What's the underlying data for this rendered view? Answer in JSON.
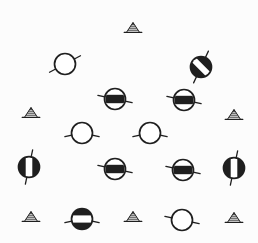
{
  "canvas": {
    "width": 258,
    "height": 243,
    "background": "#fcfcfc",
    "ink": "#1f1f1f"
  },
  "symbols": [
    {
      "type": "triangle",
      "x": 133,
      "y": 28
    },
    {
      "type": "circle",
      "x": 65,
      "y": 64,
      "fill": "white",
      "band": "none",
      "stubs": [
        -28,
        152
      ]
    },
    {
      "type": "circle",
      "x": 201,
      "y": 67,
      "fill": "black",
      "band": "diagonal-white",
      "band_angle": 45,
      "band_thickness": 6,
      "stubs": [
        -65,
        115
      ]
    },
    {
      "type": "circle",
      "x": 115,
      "y": 99,
      "fill": "white",
      "band": "horizontal-black",
      "band_angle": 0,
      "band_thickness": 8.4,
      "stubs": [
        12,
        192
      ]
    },
    {
      "type": "circle",
      "x": 184,
      "y": 100,
      "fill": "white",
      "band": "horizontal-black",
      "band_angle": 0,
      "band_thickness": 8.4,
      "stubs": [
        12,
        192
      ]
    },
    {
      "type": "triangle",
      "x": 31,
      "y": 113
    },
    {
      "type": "triangle",
      "x": 234,
      "y": 115
    },
    {
      "type": "circle",
      "x": 82,
      "y": 133,
      "fill": "white",
      "band": "none",
      "stubs": [
        12,
        168
      ]
    },
    {
      "type": "circle",
      "x": 150,
      "y": 133,
      "fill": "white",
      "band": "none",
      "stubs": [
        12,
        168
      ]
    },
    {
      "type": "circle",
      "x": 29,
      "y": 167,
      "fill": "black",
      "band": "vertical-white",
      "band_angle": 90,
      "band_thickness": 6.6,
      "stubs": [
        -78,
        102
      ]
    },
    {
      "type": "circle",
      "x": 115,
      "y": 169,
      "fill": "white",
      "band": "horizontal-black",
      "band_angle": 0,
      "band_thickness": 8.4,
      "stubs": [
        12,
        192
      ]
    },
    {
      "type": "circle",
      "x": 183,
      "y": 170,
      "fill": "white",
      "band": "horizontal-black",
      "band_angle": 0,
      "band_thickness": 8.4,
      "stubs": [
        12,
        192
      ]
    },
    {
      "type": "circle",
      "x": 234,
      "y": 168,
      "fill": "black",
      "band": "vertical-white",
      "band_angle": 90,
      "band_thickness": 6.6,
      "stubs": [
        -78,
        102
      ]
    },
    {
      "type": "triangle",
      "x": 31,
      "y": 217
    },
    {
      "type": "circle",
      "x": 82,
      "y": 219,
      "fill": "black",
      "band": "horizontal-white",
      "band_angle": 0,
      "band_thickness": 7.2,
      "stubs": [
        12,
        168
      ]
    },
    {
      "type": "triangle",
      "x": 133,
      "y": 217
    },
    {
      "type": "circle",
      "x": 182,
      "y": 220,
      "fill": "white",
      "band": "none",
      "stubs": [
        12,
        192
      ]
    },
    {
      "type": "triangle",
      "x": 234,
      "y": 218
    }
  ]
}
